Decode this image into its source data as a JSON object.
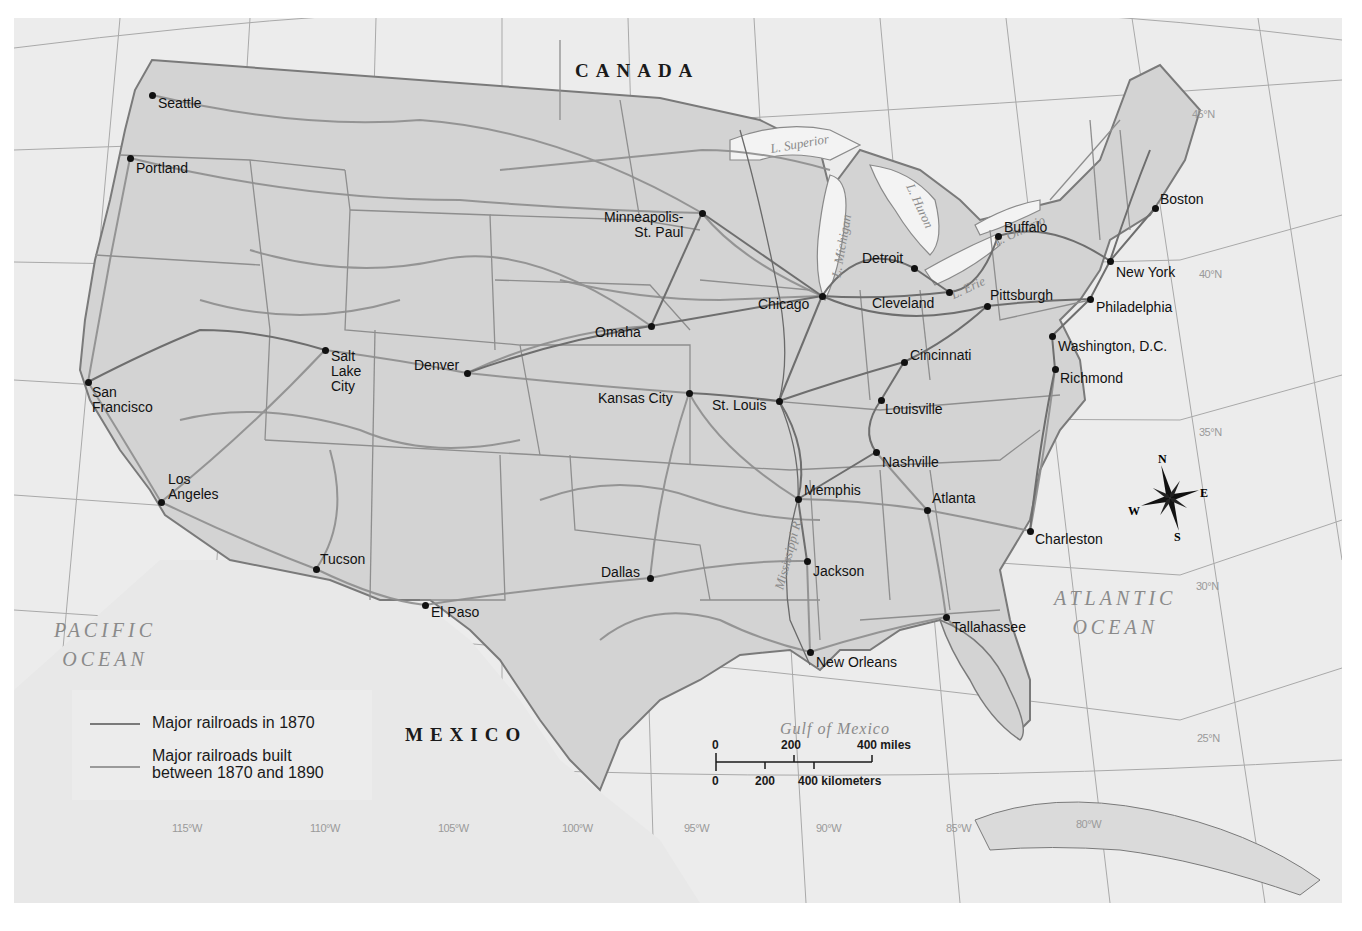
{
  "map": {
    "title": "Major railroads 1870-1890",
    "colors": {
      "background": "#ececec",
      "land_us": "#d4d4d4",
      "land_foreign": "#ebebeb",
      "water": "#ececec",
      "lake": "#f4f4f4",
      "railroad_1870": "#6e6e6e",
      "railroad_1890": "#8a8a8a",
      "border": "#7a7a7a",
      "graticule": "#a8a8a8"
    },
    "countries": [
      {
        "name": "CANADA",
        "x": 575,
        "y": 60
      },
      {
        "name": "MEXICO",
        "x": 405,
        "y": 724
      }
    ],
    "water_bodies": [
      {
        "name": "PACIFIC\nOCEAN",
        "line1": "PACIFIC",
        "line2": "OCEAN"
      },
      {
        "name": "ATLANTIC\nOCEAN",
        "line1": "ATLANTIC",
        "line2": "OCEAN"
      },
      {
        "name": "Gulf of Mexico"
      }
    ],
    "lakes": [
      "L. Superior",
      "L. Michigan",
      "L. Huron",
      "L. Ontario",
      "L. Erie"
    ],
    "rivers": [
      "Mississippi R."
    ],
    "cities": [
      {
        "name": "Seattle",
        "dot": [
          152,
          95
        ],
        "label": [
          158,
          96
        ]
      },
      {
        "name": "Portland",
        "dot": [
          130,
          158
        ],
        "label": [
          136,
          161
        ]
      },
      {
        "name": "San\nFrancisco",
        "dot": [
          88,
          382
        ],
        "label": [
          92,
          385
        ]
      },
      {
        "name": "Los\nAngeles",
        "dot": [
          161,
          502
        ],
        "label": [
          168,
          472
        ]
      },
      {
        "name": "Salt\nLake\nCity",
        "dot": [
          325,
          350
        ],
        "label": [
          331,
          349
        ]
      },
      {
        "name": "Denver",
        "dot": [
          467,
          373
        ],
        "label": [
          414,
          358
        ]
      },
      {
        "name": "Tucson",
        "dot": [
          316,
          569
        ],
        "label": [
          320,
          552
        ]
      },
      {
        "name": "El Paso",
        "dot": [
          425,
          605
        ],
        "label": [
          431,
          605
        ]
      },
      {
        "name": "Minneapolis-\nSt. Paul",
        "dot": [
          702,
          213
        ],
        "label": [
          604,
          210
        ]
      },
      {
        "name": "Omaha",
        "dot": [
          651,
          326
        ],
        "label": [
          595,
          325
        ]
      },
      {
        "name": "Kansas City",
        "dot": [
          689,
          393
        ],
        "label": [
          598,
          391
        ]
      },
      {
        "name": "St. Louis",
        "dot": [
          779,
          401
        ],
        "label": [
          712,
          398
        ]
      },
      {
        "name": "Chicago",
        "dot": [
          822,
          296
        ],
        "label": [
          758,
          297
        ]
      },
      {
        "name": "Dallas",
        "dot": [
          650,
          578
        ],
        "label": [
          601,
          565
        ]
      },
      {
        "name": "Memphis",
        "dot": [
          798,
          499
        ],
        "label": [
          804,
          483
        ]
      },
      {
        "name": "Jackson",
        "dot": [
          807,
          561
        ],
        "label": [
          813,
          564
        ]
      },
      {
        "name": "New Orleans",
        "dot": [
          810,
          652
        ],
        "label": [
          816,
          655
        ]
      },
      {
        "name": "Nashville",
        "dot": [
          876,
          452
        ],
        "label": [
          882,
          455
        ]
      },
      {
        "name": "Louisville",
        "dot": [
          881,
          400
        ],
        "label": [
          885,
          402
        ]
      },
      {
        "name": "Cincinnati",
        "dot": [
          904,
          362
        ],
        "label": [
          910,
          348
        ]
      },
      {
        "name": "Atlanta",
        "dot": [
          927,
          510
        ],
        "label": [
          932,
          491
        ]
      },
      {
        "name": "Tallahassee",
        "dot": [
          946,
          617
        ],
        "label": [
          952,
          620
        ]
      },
      {
        "name": "Charleston",
        "dot": [
          1030,
          531
        ],
        "label": [
          1035,
          532
        ]
      },
      {
        "name": "Detroit",
        "dot": [
          914,
          268
        ],
        "label": [
          862,
          251
        ]
      },
      {
        "name": "Cleveland",
        "dot": [
          949,
          292
        ],
        "label": [
          872,
          296
        ]
      },
      {
        "name": "Buffalo",
        "dot": [
          998,
          236
        ],
        "label": [
          1004,
          220
        ]
      },
      {
        "name": "Pittsburgh",
        "dot": [
          987,
          306
        ],
        "label": [
          990,
          288
        ]
      },
      {
        "name": "Richmond",
        "dot": [
          1055,
          369
        ],
        "label": [
          1060,
          371
        ]
      },
      {
        "name": "Washington, D.C.",
        "dot": [
          1052,
          336
        ],
        "label": [
          1058,
          339
        ]
      },
      {
        "name": "Philadelphia",
        "dot": [
          1090,
          299
        ],
        "label": [
          1096,
          300
        ]
      },
      {
        "name": "New York",
        "dot": [
          1110,
          261
        ],
        "label": [
          1116,
          265
        ]
      },
      {
        "name": "Boston",
        "dot": [
          1155,
          208
        ],
        "label": [
          1160,
          192
        ]
      }
    ],
    "longitude_labels": [
      "115°W",
      "110°W",
      "105°W",
      "100°W",
      "95°W",
      "90°W",
      "85°W",
      "80°W"
    ],
    "latitude_labels": [
      "45°N",
      "40°N",
      "35°N",
      "30°N",
      "25°N"
    ],
    "legend": {
      "items": [
        {
          "label": "Major railroads in 1870",
          "color": "#6e6e6e"
        },
        {
          "label_line1": "Major railroads built",
          "label_line2": "between 1870 and 1890",
          "color": "#8a8a8a"
        }
      ]
    },
    "scale_bar": {
      "miles_ticks": [
        "0",
        "200",
        "400 miles"
      ],
      "km_ticks": [
        "0",
        "200",
        "400 kilometers"
      ]
    },
    "compass": {
      "north": "N",
      "south": "S",
      "east": "E",
      "west": "W"
    }
  }
}
